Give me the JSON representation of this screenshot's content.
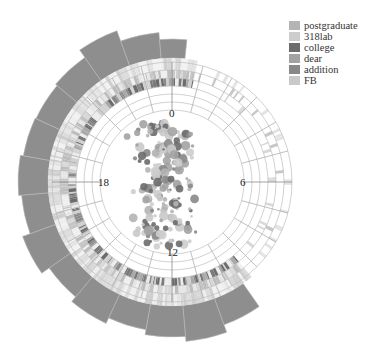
{
  "chart_data": {
    "type": "radial-composite",
    "title": "",
    "center": [
      172,
      182
    ],
    "angular_axis": {
      "unit": "hour",
      "range": [
        0,
        24
      ],
      "direction": "clockwise",
      "zero_position": "top",
      "tick_labels": [
        "0",
        "6",
        "12",
        "18"
      ]
    },
    "legend": {
      "position": "top-right",
      "entries": [
        {
          "name": "postgraduate",
          "color": "#b4b4b4"
        },
        {
          "name": "318lab",
          "color": "#cdcdcd"
        },
        {
          "name": "college",
          "color": "#6c6c6c"
        },
        {
          "name": "dear",
          "color": "#a3a3a3"
        },
        {
          "name": "addition",
          "color": "#888888"
        },
        {
          "name": "FB",
          "color": "#c9c9c9"
        }
      ]
    },
    "grid": {
      "inner_radius": 72,
      "ring_radii": [
        72,
        80,
        88,
        96,
        104,
        112,
        120
      ],
      "sector_hours": [
        0,
        1,
        2,
        3,
        4,
        5,
        6,
        7,
        8,
        9,
        10,
        11,
        12,
        13,
        14,
        15,
        16,
        17,
        18,
        19,
        20,
        21,
        22,
        23
      ]
    },
    "outer_bars": {
      "color": "#8e8e8e",
      "inner_radius": 124,
      "segments": [
        {
          "start_deg": 145,
          "end_deg": 160,
          "outer_radius": 152
        },
        {
          "start_deg": 160,
          "end_deg": 175,
          "outer_radius": 160
        },
        {
          "start_deg": 175,
          "end_deg": 190,
          "outer_radius": 155
        },
        {
          "start_deg": 190,
          "end_deg": 205,
          "outer_radius": 150
        },
        {
          "start_deg": 205,
          "end_deg": 220,
          "outer_radius": 156
        },
        {
          "start_deg": 220,
          "end_deg": 235,
          "outer_radius": 150
        },
        {
          "start_deg": 235,
          "end_deg": 250,
          "outer_radius": 159
        },
        {
          "start_deg": 250,
          "end_deg": 265,
          "outer_radius": 151
        },
        {
          "start_deg": 265,
          "end_deg": 280,
          "outer_radius": 154
        },
        {
          "start_deg": 280,
          "end_deg": 295,
          "outer_radius": 151
        },
        {
          "start_deg": 295,
          "end_deg": 310,
          "outer_radius": 150
        },
        {
          "start_deg": 310,
          "end_deg": 325,
          "outer_radius": 152
        },
        {
          "start_deg": 325,
          "end_deg": 340,
          "outer_radius": 161
        },
        {
          "start_deg": 340,
          "end_deg": 355,
          "outer_radius": 150
        },
        {
          "start_deg": 355,
          "end_deg": 366,
          "outer_radius": 143
        }
      ]
    },
    "bands": {
      "start_deg": 140,
      "end_deg": 372,
      "rings": [
        {
          "r0": 112,
          "r1": 124,
          "palette": [
            "#e4e4e4",
            "#d6d6d6",
            "#eeeeee",
            "#cfcfcf",
            "#f2f2f2",
            "#dcdcdc"
          ]
        },
        {
          "r0": 104,
          "r1": 112,
          "palette": [
            "#d8d8d8",
            "#c4c4c4",
            "#e6e6e6",
            "#bdbdbd",
            "#efefef"
          ]
        },
        {
          "r0": 96,
          "r1": 104,
          "palette": [
            "#6c6c6c",
            "#8a8a8a",
            "#a8a8a8",
            "#d0d0d0",
            "#ececec",
            "#7a7a7a"
          ]
        }
      ]
    },
    "scatter": {
      "region_radius": 68,
      "point_count": 190,
      "colors": [
        "#b4b4b4",
        "#cdcdcd",
        "#6c6c6c",
        "#a3a3a3",
        "#888888",
        "#c9c9c9"
      ]
    }
  }
}
